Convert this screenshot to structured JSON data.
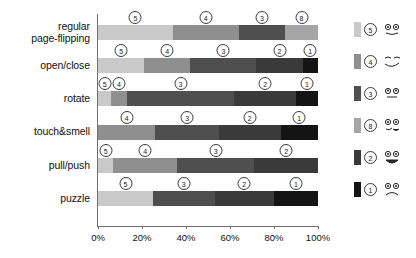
{
  "chart_data": {
    "type": "bar",
    "orientation": "horizontal",
    "stacked": true,
    "normalized_percent": true,
    "title": "",
    "subtitle": "",
    "xlabel": "",
    "ylabel": "",
    "xlim": [
      0,
      100
    ],
    "grid": false,
    "legend_position": "right",
    "categories": [
      "regular\npage-flipping",
      "open/close",
      "rotate",
      "touch&smell",
      "pull/push",
      "puzzle"
    ],
    "category_labels": [
      [
        "regular",
        "page-flipping"
      ],
      [
        "open/close"
      ],
      [
        "rotate"
      ],
      [
        "touch&smell"
      ],
      [
        "pull/push"
      ],
      [
        "puzzle"
      ]
    ],
    "tick_labels": [
      "0%",
      "20%",
      "40%",
      "60%",
      "80%",
      "100%"
    ],
    "tick_values": [
      0,
      20,
      40,
      60,
      80,
      100
    ],
    "series": [
      {
        "name": "5",
        "values": [
          34,
          21,
          6,
          0,
          7,
          25
        ]
      },
      {
        "name": "4",
        "values": [
          30,
          21,
          7,
          26,
          29,
          0
        ]
      },
      {
        "name": "3",
        "values": [
          21,
          30,
          49,
          29,
          35,
          28
        ]
      },
      {
        "name": "8",
        "values": [
          15,
          0,
          0,
          0,
          0,
          0
        ]
      },
      {
        "name": "2",
        "values": [
          0,
          21,
          28,
          28,
          29,
          27
        ]
      },
      {
        "name": "1",
        "values": [
          0,
          7,
          10,
          17,
          0,
          20
        ]
      }
    ],
    "rows": [
      {
        "label_lines": [
          "regular",
          "page-flipping"
        ],
        "segments": [
          {
            "rating": "5",
            "start": 0,
            "end": 34,
            "value": 34
          },
          {
            "rating": "4",
            "start": 34,
            "end": 64,
            "value": 30
          },
          {
            "rating": "3",
            "start": 64,
            "end": 85,
            "value": 21
          },
          {
            "rating": "8",
            "start": 85,
            "end": 100,
            "value": 15
          }
        ]
      },
      {
        "label_lines": [
          "open/close"
        ],
        "segments": [
          {
            "rating": "5",
            "start": 0,
            "end": 21,
            "value": 21
          },
          {
            "rating": "4",
            "start": 21,
            "end": 42,
            "value": 21
          },
          {
            "rating": "3",
            "start": 42,
            "end": 72,
            "value": 30
          },
          {
            "rating": "2",
            "start": 72,
            "end": 93,
            "value": 21
          },
          {
            "rating": "1",
            "start": 93,
            "end": 100,
            "value": 7
          }
        ]
      },
      {
        "label_lines": [
          "rotate"
        ],
        "segments": [
          {
            "rating": "5",
            "start": 0,
            "end": 6,
            "value": 6
          },
          {
            "rating": "4",
            "start": 6,
            "end": 13,
            "value": 7
          },
          {
            "rating": "3",
            "start": 13,
            "end": 62,
            "value": 49
          },
          {
            "rating": "2",
            "start": 62,
            "end": 90,
            "value": 28
          },
          {
            "rating": "1",
            "start": 90,
            "end": 100,
            "value": 10
          }
        ]
      },
      {
        "label_lines": [
          "touch&smell"
        ],
        "segments": [
          {
            "rating": "4",
            "start": 0,
            "end": 26,
            "value": 26
          },
          {
            "rating": "3",
            "start": 26,
            "end": 55,
            "value": 29
          },
          {
            "rating": "2",
            "start": 55,
            "end": 83,
            "value": 28
          },
          {
            "rating": "1",
            "start": 83,
            "end": 100,
            "value": 17
          }
        ]
      },
      {
        "label_lines": [
          "pull/push"
        ],
        "segments": [
          {
            "rating": "5",
            "start": 0,
            "end": 7,
            "value": 7
          },
          {
            "rating": "4",
            "start": 7,
            "end": 36,
            "value": 29
          },
          {
            "rating": "3",
            "start": 36,
            "end": 71,
            "value": 35
          },
          {
            "rating": "2",
            "start": 71,
            "end": 100,
            "value": 29
          }
        ]
      },
      {
        "label_lines": [
          "puzzle"
        ],
        "segments": [
          {
            "rating": "5",
            "start": 0,
            "end": 25,
            "value": 25
          },
          {
            "rating": "3",
            "start": 25,
            "end": 53,
            "value": 28
          },
          {
            "rating": "2",
            "start": 53,
            "end": 80,
            "value": 27
          },
          {
            "rating": "1",
            "start": 80,
            "end": 100,
            "value": 20
          }
        ]
      }
    ],
    "legend": [
      {
        "rating": "5",
        "color": "#c9c9c9",
        "face": "face-surprised-icon"
      },
      {
        "rating": "4",
        "color": "#8f8f8f",
        "face": "face-smiling-icon"
      },
      {
        "rating": "3",
        "color": "#4f4f4f",
        "face": "face-neutral-icon"
      },
      {
        "rating": "8",
        "color": "#a5a5a5",
        "face": "face-confused-icon"
      },
      {
        "rating": "2",
        "color": "#3a3a3a",
        "face": "face-open-mouth-icon"
      },
      {
        "rating": "1",
        "color": "#141414",
        "face": "face-sad-icon"
      }
    ],
    "colors": {
      "rating_5": "#c9c9c9",
      "rating_4": "#8f8f8f",
      "rating_3": "#4f4f4f",
      "rating_8": "#a5a5a5",
      "rating_2": "#3a3a3a",
      "rating_1": "#141414",
      "axis": "#6f6f6f",
      "text": "#111111",
      "background": "#ffffff"
    }
  }
}
